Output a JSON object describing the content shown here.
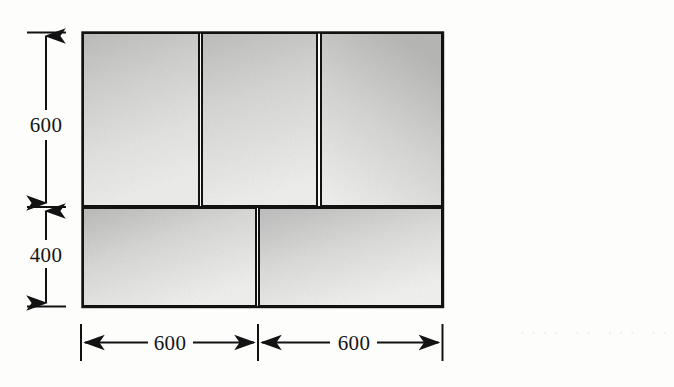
{
  "figure": {
    "units_note": "",
    "line_color": "#121212",
    "block_fill_light": "#e8e8e6",
    "block_fill_dark": "#bdbdbb",
    "background": "#fdfdfc"
  },
  "dimensions": {
    "vertical": [
      {
        "id": "upper-course-height",
        "label": "600"
      },
      {
        "id": "lower-course-height",
        "label": "400"
      }
    ],
    "horizontal": [
      {
        "id": "left-bay-width",
        "label": "600"
      },
      {
        "id": "right-bay-width",
        "label": "600"
      }
    ]
  },
  "blocks": {
    "top_row": [
      {
        "id": "top-block-1",
        "label": ""
      },
      {
        "id": "top-block-2",
        "label": ""
      },
      {
        "id": "top-block-3",
        "label": ""
      }
    ],
    "bottom_row": [
      {
        "id": "bottom-block-1",
        "label": ""
      },
      {
        "id": "bottom-block-2",
        "label": ""
      }
    ]
  },
  "artifacts": {
    "bleed_through_text": "·· ··· ·· ····"
  }
}
